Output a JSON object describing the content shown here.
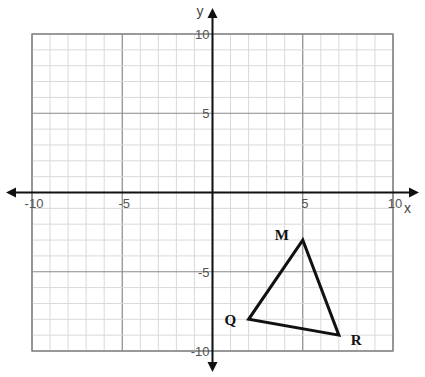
{
  "graph": {
    "x_axis_label": "x",
    "y_axis_label": "y",
    "x_range": [
      -10,
      10
    ],
    "y_range": [
      -10,
      10
    ],
    "minor_step": 1,
    "major_step": 5,
    "x_ticks": [
      {
        "value": -10,
        "label": "-10"
      },
      {
        "value": -5,
        "label": "-5"
      },
      {
        "value": 5,
        "label": "5"
      },
      {
        "value": 10,
        "label": "10"
      }
    ],
    "y_ticks": [
      {
        "value": 10,
        "label": "10"
      },
      {
        "value": 5,
        "label": "5"
      },
      {
        "value": -5,
        "label": "-5"
      },
      {
        "value": -10,
        "label": "-10"
      }
    ],
    "colors": {
      "minor_grid": "#d9d9d9",
      "major_grid": "#8a8a8a",
      "axis": "#111111",
      "shape": "#111111"
    }
  },
  "triangle": {
    "name": "Triangle MQR",
    "vertices": [
      {
        "label": "M",
        "x": 5,
        "y": -3
      },
      {
        "label": "Q",
        "x": 2,
        "y": -8
      },
      {
        "label": "R",
        "x": 7,
        "y": -9
      }
    ]
  }
}
